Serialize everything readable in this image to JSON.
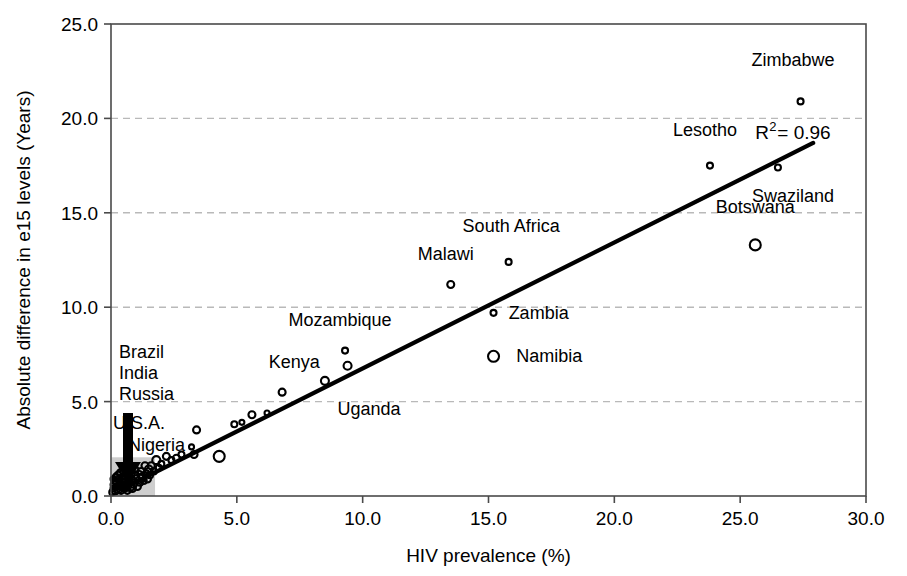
{
  "chart_data": {
    "type": "scatter",
    "title": "",
    "xlabel": "HIV prevalence (%)",
    "ylabel": "Absolute difference in e15 levels (Years)",
    "xlim": [
      0.0,
      30.0
    ],
    "ylim": [
      0.0,
      25.0
    ],
    "xticks": [
      "0.0",
      "5.0",
      "10.0",
      "15.0",
      "20.0",
      "25.0",
      "30.0"
    ],
    "yticks": [
      "0.0",
      "5.0",
      "10.0",
      "15.0",
      "20.0",
      "25.0"
    ],
    "xtick_values": [
      0,
      5,
      10,
      15,
      20,
      25,
      30
    ],
    "ytick_values": [
      0,
      5,
      10,
      15,
      20,
      25
    ],
    "grid": "horizontal-dashed",
    "legend": "none",
    "annotations": [
      {
        "name": "r-squared",
        "text": "R",
        "sup": "2",
        "rest": "= 0.96",
        "x": 25.6,
        "y": 18.9
      },
      {
        "name": "cluster-arrow",
        "text": "",
        "x": 0.75,
        "y": 3.6,
        "note": "downward arrow pointing to dense low-prevalence cluster"
      }
    ],
    "labeled_points": [
      {
        "label": "Zimbabwe",
        "x": 27.4,
        "y": 20.9,
        "size": 6,
        "label_dx": -0.3,
        "label_dy": 2.2,
        "anchor": "middle"
      },
      {
        "label": "Lesotho",
        "x": 23.8,
        "y": 17.5,
        "size": 6,
        "label_dx": -0.2,
        "label_dy": 1.9,
        "anchor": "middle"
      },
      {
        "label": "Swaziland",
        "x": 26.5,
        "y": 17.4,
        "size": 6,
        "label_dx": 0.6,
        "label_dy": -1.5,
        "anchor": "middle"
      },
      {
        "label": "Botswana",
        "x": 25.6,
        "y": 13.3,
        "size": 11,
        "label_dx": 0.0,
        "label_dy": 2.0,
        "anchor": "middle"
      },
      {
        "label": "South Africa",
        "x": 15.8,
        "y": 12.4,
        "size": 6,
        "label_dx": 0.1,
        "label_dy": 1.9,
        "anchor": "middle"
      },
      {
        "label": "Malawi",
        "x": 13.5,
        "y": 11.2,
        "size": 7,
        "label_dx": -0.2,
        "label_dy": 1.6,
        "anchor": "middle"
      },
      {
        "label": "Zambia",
        "x": 15.2,
        "y": 9.7,
        "size": 6,
        "label_dx": 0.6,
        "label_dy": 0.0,
        "anchor": "start"
      },
      {
        "label": "Namibia",
        "x": 15.2,
        "y": 7.4,
        "size": 11,
        "label_dx": 0.9,
        "label_dy": 0.0,
        "anchor": "start"
      },
      {
        "label": "Mozambique",
        "x": 9.3,
        "y": 7.7,
        "size": 6,
        "label_dx": -0.2,
        "label_dy": 1.6,
        "anchor": "middle"
      },
      {
        "label": "Kenya",
        "x": 9.4,
        "y": 6.9,
        "size": 8,
        "label_dx": -1.1,
        "label_dy": 0.2,
        "anchor": "end"
      },
      {
        "label": "Uganda",
        "x": 8.5,
        "y": 6.1,
        "size": 8,
        "label_dx": 0.5,
        "label_dy": -1.5,
        "anchor": "start"
      }
    ],
    "cluster_labels": [
      "Brazil",
      "India",
      "Russia",
      "U.S.A.",
      "Nigeria"
    ],
    "points": [
      {
        "x": 27.4,
        "y": 20.9,
        "size": 6
      },
      {
        "x": 23.8,
        "y": 17.5,
        "size": 6
      },
      {
        "x": 26.5,
        "y": 17.4,
        "size": 6
      },
      {
        "x": 25.6,
        "y": 13.3,
        "size": 11
      },
      {
        "x": 15.8,
        "y": 12.4,
        "size": 6
      },
      {
        "x": 13.5,
        "y": 11.2,
        "size": 7
      },
      {
        "x": 15.2,
        "y": 9.7,
        "size": 6
      },
      {
        "x": 15.2,
        "y": 7.4,
        "size": 11
      },
      {
        "x": 9.3,
        "y": 7.7,
        "size": 6
      },
      {
        "x": 9.4,
        "y": 6.9,
        "size": 8
      },
      {
        "x": 8.5,
        "y": 6.1,
        "size": 8
      },
      {
        "x": 6.8,
        "y": 5.5,
        "size": 7
      },
      {
        "x": 6.2,
        "y": 4.4,
        "size": 5
      },
      {
        "x": 5.6,
        "y": 4.3,
        "size": 7
      },
      {
        "x": 5.2,
        "y": 3.9,
        "size": 5
      },
      {
        "x": 4.9,
        "y": 3.8,
        "size": 6
      },
      {
        "x": 3.4,
        "y": 3.5,
        "size": 7
      },
      {
        "x": 3.2,
        "y": 2.6,
        "size": 5
      },
      {
        "x": 4.3,
        "y": 2.1,
        "size": 11
      },
      {
        "x": 3.3,
        "y": 2.2,
        "size": 7
      },
      {
        "x": 2.8,
        "y": 2.2,
        "size": 6
      },
      {
        "x": 2.6,
        "y": 2.0,
        "size": 7
      },
      {
        "x": 2.4,
        "y": 1.9,
        "size": 6
      },
      {
        "x": 2.2,
        "y": 2.1,
        "size": 7
      },
      {
        "x": 2.0,
        "y": 1.7,
        "size": 6
      },
      {
        "x": 1.9,
        "y": 1.5,
        "size": 6
      },
      {
        "x": 1.8,
        "y": 1.9,
        "size": 8
      },
      {
        "x": 1.7,
        "y": 1.3,
        "size": 6
      },
      {
        "x": 1.6,
        "y": 1.6,
        "size": 7
      },
      {
        "x": 1.55,
        "y": 1.1,
        "size": 6
      },
      {
        "x": 1.5,
        "y": 1.4,
        "size": 8
      },
      {
        "x": 1.45,
        "y": 0.9,
        "size": 7
      },
      {
        "x": 1.4,
        "y": 1.2,
        "size": 6
      },
      {
        "x": 1.35,
        "y": 1.6,
        "size": 7
      },
      {
        "x": 1.3,
        "y": 0.8,
        "size": 6
      },
      {
        "x": 1.25,
        "y": 1.0,
        "size": 8
      },
      {
        "x": 1.2,
        "y": 1.3,
        "size": 7
      },
      {
        "x": 1.15,
        "y": 0.7,
        "size": 6
      },
      {
        "x": 1.1,
        "y": 1.1,
        "size": 9
      },
      {
        "x": 1.05,
        "y": 0.5,
        "size": 7
      },
      {
        "x": 1.0,
        "y": 0.9,
        "size": 8
      },
      {
        "x": 0.95,
        "y": 1.4,
        "size": 7
      },
      {
        "x": 0.9,
        "y": 0.6,
        "size": 6
      },
      {
        "x": 0.88,
        "y": 1.1,
        "size": 9
      },
      {
        "x": 0.85,
        "y": 0.4,
        "size": 7
      },
      {
        "x": 0.8,
        "y": 0.8,
        "size": 8
      },
      {
        "x": 0.78,
        "y": 1.3,
        "size": 6
      },
      {
        "x": 0.75,
        "y": 0.5,
        "size": 9
      },
      {
        "x": 0.72,
        "y": 1.0,
        "size": 7
      },
      {
        "x": 0.7,
        "y": 0.7,
        "size": 8
      },
      {
        "x": 0.68,
        "y": 1.2,
        "size": 6
      },
      {
        "x": 0.65,
        "y": 0.3,
        "size": 7
      },
      {
        "x": 0.62,
        "y": 0.9,
        "size": 9
      },
      {
        "x": 0.6,
        "y": 0.6,
        "size": 7
      },
      {
        "x": 0.58,
        "y": 1.1,
        "size": 8
      },
      {
        "x": 0.55,
        "y": 0.4,
        "size": 6
      },
      {
        "x": 0.52,
        "y": 0.8,
        "size": 9
      },
      {
        "x": 0.5,
        "y": 1.3,
        "size": 7
      },
      {
        "x": 0.48,
        "y": 0.5,
        "size": 8
      },
      {
        "x": 0.45,
        "y": 1.0,
        "size": 6
      },
      {
        "x": 0.42,
        "y": 0.7,
        "size": 9
      },
      {
        "x": 0.4,
        "y": 0.3,
        "size": 7
      },
      {
        "x": 0.38,
        "y": 1.2,
        "size": 8
      },
      {
        "x": 0.35,
        "y": 0.6,
        "size": 7
      },
      {
        "x": 0.33,
        "y": 0.9,
        "size": 6
      },
      {
        "x": 0.3,
        "y": 0.4,
        "size": 9
      },
      {
        "x": 0.28,
        "y": 1.1,
        "size": 7
      },
      {
        "x": 0.25,
        "y": 0.7,
        "size": 8
      },
      {
        "x": 0.22,
        "y": 0.5,
        "size": 6
      },
      {
        "x": 0.2,
        "y": 1.0,
        "size": 7
      },
      {
        "x": 0.18,
        "y": 0.3,
        "size": 8
      },
      {
        "x": 0.15,
        "y": 0.8,
        "size": 6
      },
      {
        "x": 0.12,
        "y": 0.6,
        "size": 7
      },
      {
        "x": 0.1,
        "y": 0.4,
        "size": 6
      },
      {
        "x": 0.08,
        "y": 0.9,
        "size": 5
      },
      {
        "x": 0.05,
        "y": 0.2,
        "size": 6
      }
    ],
    "trendline": {
      "x0": 0.4,
      "y0": 0.35,
      "x1": 27.9,
      "y1": 18.7
    }
  }
}
